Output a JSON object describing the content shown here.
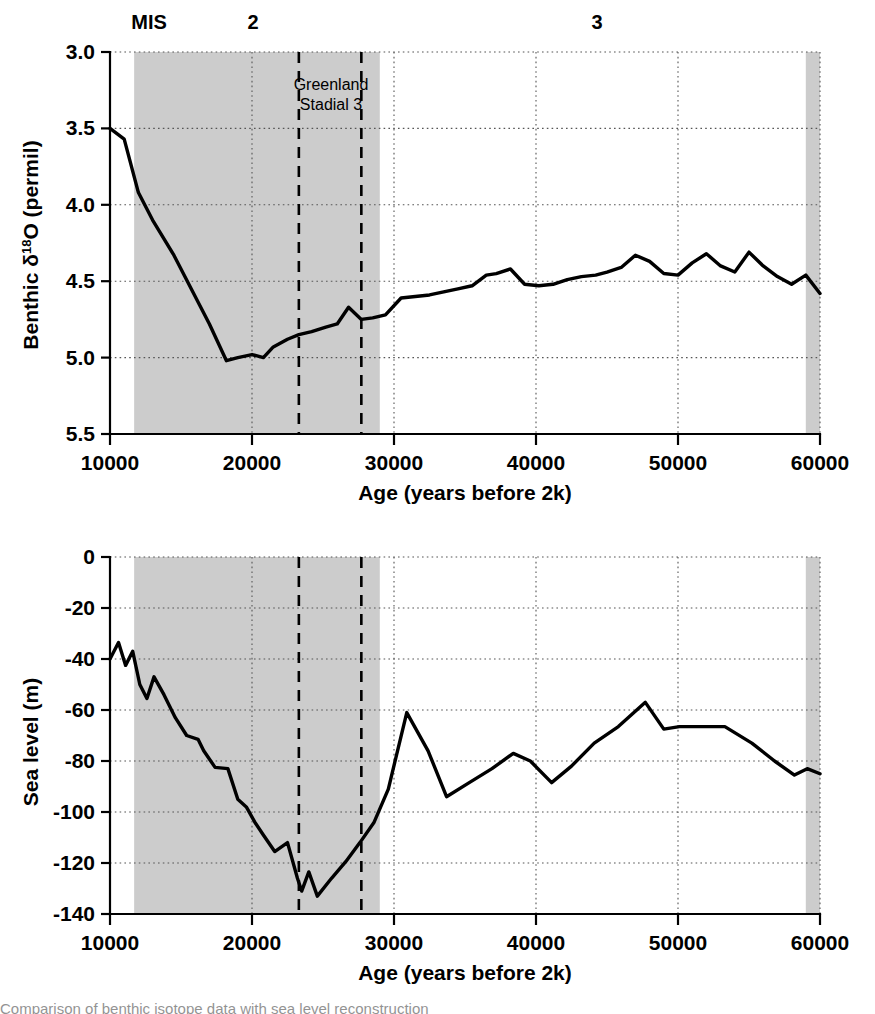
{
  "figure": {
    "xlabel": "Age (years before 2k)",
    "x_ticks": [
      "10000",
      "20000",
      "30000",
      "40000",
      "50000",
      "60000"
    ],
    "mis_label": "MIS",
    "mis_stage_2": "2",
    "mis_stage_3": "3",
    "annotation_line1": "Greenland",
    "annotation_line2": "Stadial 3",
    "caption_partial": "Comparison of benthic isotope data with sea level reconstruction"
  },
  "chart_data": [
    {
      "type": "line",
      "title": "",
      "xlabel": "Age (years before 2k)",
      "ylabel": "Benthic δ¹⁸O (permil)",
      "ylabel_parts": {
        "prefix": "Benthic ",
        "delta": "δ",
        "sup": "18",
        "o": "O",
        "suffix": " (permil)"
      },
      "xlim": [
        10000,
        60000
      ],
      "ylim": [
        5.5,
        3.0
      ],
      "y_inverted": true,
      "xticks": [
        10000,
        20000,
        30000,
        40000,
        50000,
        60000
      ],
      "yticks": [
        3.0,
        3.5,
        4.0,
        4.5,
        5.0,
        5.5
      ],
      "ytick_labels": [
        "3.0",
        "3.5",
        "4.0",
        "4.5",
        "5.0",
        "5.5"
      ],
      "grid": true,
      "legend": "none",
      "shaded_bands": [
        {
          "label": "MIS 2",
          "x0": 11700,
          "x1": 29000,
          "color": "#cccccc"
        },
        {
          "label": "MIS 4 edge",
          "x0": 59000,
          "x1": 60000,
          "color": "#cccccc"
        }
      ],
      "vertical_markers": [
        {
          "label": "Greenland Stadial 3 start",
          "x": 23300
        },
        {
          "label": "Greenland Stadial 3 end",
          "x": 27700
        }
      ],
      "x": [
        10000,
        11000,
        12000,
        13000,
        14500,
        16000,
        17000,
        18200,
        19000,
        20000,
        20800,
        21500,
        22500,
        23300,
        24200,
        25200,
        26000,
        26800,
        27700,
        28500,
        29400,
        30500,
        31500,
        32500,
        33500,
        34500,
        35500,
        36500,
        37200,
        38200,
        39200,
        40200,
        41200,
        42200,
        43200,
        44200,
        45000,
        46000,
        47000,
        48000,
        49000,
        50000,
        51000,
        52000,
        53000,
        54000,
        55000,
        56000,
        57000,
        58000,
        59000,
        60000
      ],
      "y": [
        3.5,
        3.57,
        3.92,
        4.1,
        4.33,
        4.6,
        4.78,
        5.02,
        5.0,
        4.98,
        5.0,
        4.93,
        4.88,
        4.85,
        4.83,
        4.8,
        4.78,
        4.67,
        4.75,
        4.74,
        4.72,
        4.61,
        4.6,
        4.59,
        4.57,
        4.55,
        4.53,
        4.46,
        4.45,
        4.42,
        4.52,
        4.53,
        4.52,
        4.49,
        4.47,
        4.46,
        4.44,
        4.41,
        4.33,
        4.37,
        4.45,
        4.46,
        4.38,
        4.32,
        4.4,
        4.44,
        4.31,
        4.4,
        4.47,
        4.52,
        4.46,
        4.58
      ]
    },
    {
      "type": "line",
      "title": "",
      "xlabel": "Age (years before 2k)",
      "ylabel": "Sea level (m)",
      "xlim": [
        10000,
        60000
      ],
      "ylim": [
        -140,
        0
      ],
      "y_inverted": false,
      "xticks": [
        10000,
        20000,
        30000,
        40000,
        50000,
        60000
      ],
      "yticks": [
        0,
        -20,
        -40,
        -60,
        -80,
        -100,
        -120,
        -140
      ],
      "ytick_labels": [
        "0",
        "-20",
        "-40",
        "-60",
        "-80",
        "-100",
        "-120",
        "-140"
      ],
      "grid": true,
      "legend": "none",
      "shaded_bands": [
        {
          "label": "MIS 2",
          "x0": 11700,
          "x1": 29000,
          "color": "#cccccc"
        },
        {
          "label": "MIS 4 edge",
          "x0": 59000,
          "x1": 60000,
          "color": "#cccccc"
        }
      ],
      "vertical_markers": [
        {
          "label": "Greenland Stadial 3 start",
          "x": 23300
        },
        {
          "label": "Greenland Stadial 3 end",
          "x": 27700
        }
      ],
      "x": [
        10000,
        10600,
        11100,
        11600,
        12100,
        12600,
        13100,
        13800,
        14600,
        15400,
        16200,
        16600,
        17400,
        18300,
        19000,
        19600,
        20200,
        20800,
        21600,
        22500,
        23200,
        23500,
        24000,
        24600,
        25600,
        26600,
        27600,
        28600,
        29600,
        30900,
        32400,
        33700,
        35300,
        36900,
        38400,
        39600,
        41100,
        42500,
        44100,
        45800,
        47700,
        49000,
        50100,
        51800,
        53300,
        55200,
        56800,
        58200,
        59100,
        60000
      ],
      "y": [
        -40.0,
        -33.5,
        -42.5,
        -37.0,
        -50.0,
        -55.5,
        -47.0,
        -54.0,
        -63.0,
        -70.0,
        -71.5,
        -76.0,
        -82.5,
        -83.0,
        -95.0,
        -98.0,
        -104.0,
        -109.0,
        -115.5,
        -112.0,
        -126.0,
        -131.0,
        -123.5,
        -133.0,
        -126.0,
        -119.5,
        -112.0,
        -104.0,
        -91.0,
        -61.0,
        -76.0,
        -94.0,
        -88.5,
        -83.0,
        -77.0,
        -80.0,
        -88.5,
        -82.0,
        -73.0,
        -66.5,
        -57.0,
        -67.5,
        -66.5,
        -66.5,
        -66.5,
        -73.0,
        -80.0,
        -85.5,
        -83.0,
        -85.0
      ]
    }
  ]
}
